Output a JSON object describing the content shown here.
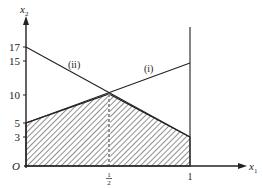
{
  "diagram": {
    "type": "linear-programming-feasible-region",
    "axes": {
      "x_label": "x",
      "x_sub": "1",
      "y_label": "x",
      "y_sub": "2",
      "origin_label": "O"
    },
    "y_ticks": [
      "17",
      "15",
      "10",
      "5",
      "3"
    ],
    "x_ticks": {
      "half_num": "1",
      "half_den": "2",
      "one": "1"
    },
    "lines": [
      {
        "id": "i",
        "label": "(i)",
        "from": [
          0,
          5
        ],
        "to": [
          1,
          15
        ]
      },
      {
        "id": "ii",
        "label": "(ii)",
        "from": [
          0,
          17
        ],
        "to": [
          1,
          3
        ]
      }
    ],
    "intersection": {
      "x": 0.5,
      "y": 10
    },
    "shaded_region_vertices": [
      [
        0,
        0
      ],
      [
        0,
        5
      ],
      [
        0.5,
        10
      ],
      [
        1,
        3
      ],
      [
        1,
        0
      ]
    ],
    "colors": {
      "ink": "#222222",
      "background": "#ffffff"
    }
  }
}
